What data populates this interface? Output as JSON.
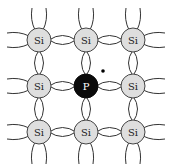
{
  "diagram": {
    "title": "Phosphorus donor impurity in silicon lattice",
    "grid": {
      "cols": 3,
      "rows": 3,
      "x": [
        39,
        86,
        133
      ],
      "y": [
        40,
        86,
        132
      ],
      "atom_radius": 12
    },
    "atoms": [
      {
        "row": 0,
        "col": 0,
        "label": "Si",
        "type": "host"
      },
      {
        "row": 0,
        "col": 1,
        "label": "Si",
        "type": "host"
      },
      {
        "row": 0,
        "col": 2,
        "label": "Si",
        "type": "host"
      },
      {
        "row": 1,
        "col": 0,
        "label": "Si",
        "type": "host"
      },
      {
        "row": 1,
        "col": 1,
        "label": "P",
        "type": "dopant"
      },
      {
        "row": 1,
        "col": 2,
        "label": "Si",
        "type": "host"
      },
      {
        "row": 2,
        "col": 0,
        "label": "Si",
        "type": "host"
      },
      {
        "row": 2,
        "col": 1,
        "label": "Si",
        "type": "host"
      },
      {
        "row": 2,
        "col": 2,
        "label": "Si",
        "type": "host"
      }
    ],
    "extra_electron": {
      "x": 103,
      "y": 71,
      "label": "free electron"
    },
    "colors": {
      "host_fill": "#dedede",
      "host_stroke": "#444444",
      "dopant_fill": "#0a0a0a",
      "dopant_text": "#ffffff",
      "bond_stroke": "#333333",
      "background": "#ffffff"
    }
  }
}
